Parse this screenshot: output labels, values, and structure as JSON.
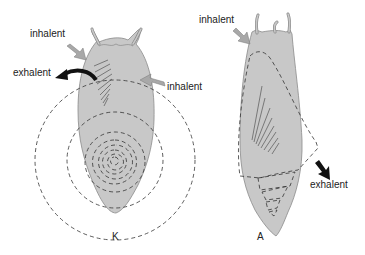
{
  "diagram": {
    "colors": {
      "body_fill": "#c8c8c8",
      "body_stroke": "#8a8a8a",
      "dashed_line": "#333333",
      "inhalent_arrow": "#a8a8a8",
      "exhalent_arrow": "#111111"
    },
    "figure_k": {
      "label": "K",
      "annotations": {
        "inhalent_top": "inhalent",
        "exhalent": "exhalent",
        "inhalent_right": "inhalent"
      }
    },
    "figure_a": {
      "label": "A",
      "annotations": {
        "inhalent_top": "inhalent",
        "exhalent": "exhalent"
      }
    }
  }
}
